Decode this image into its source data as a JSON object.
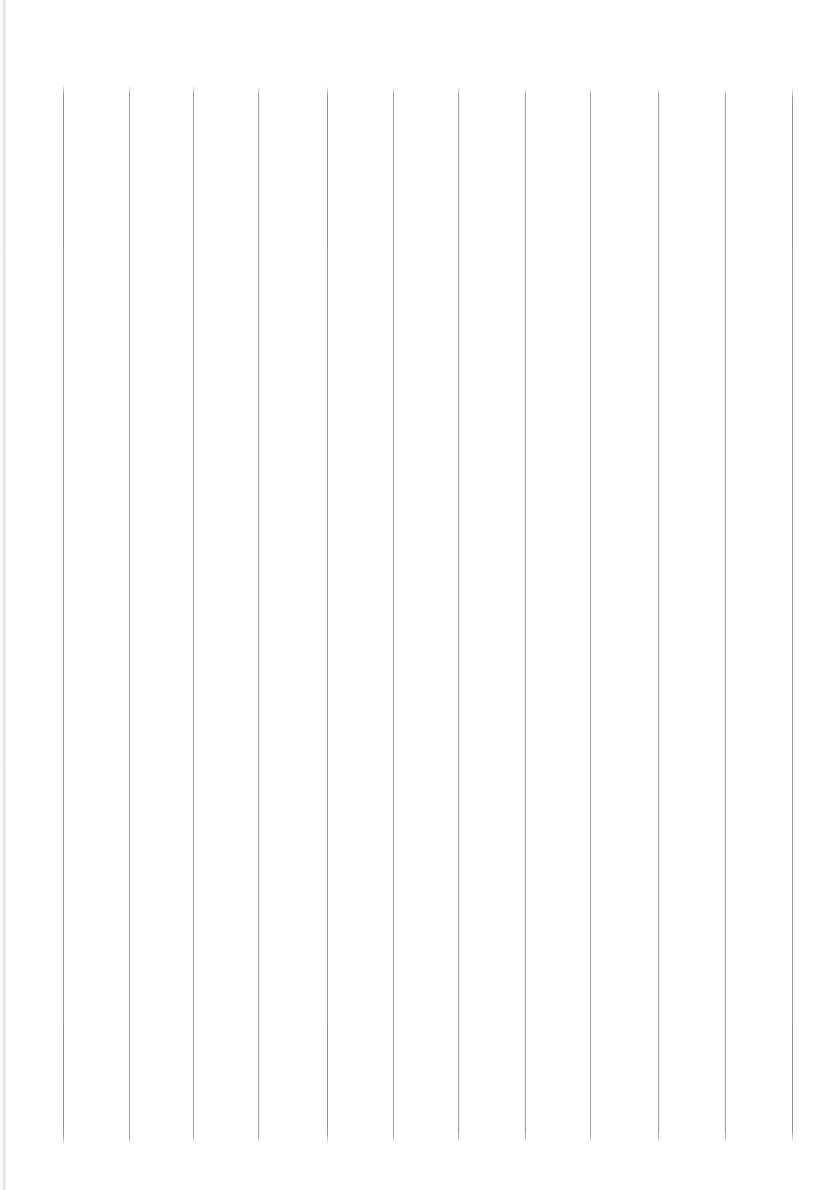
{
  "document": {
    "kind": "scanned-blank-ruled-sheet",
    "title": "",
    "visible_text": "",
    "page_width": 837,
    "page_height": 1190,
    "background_color": "#ffffff",
    "orientation": "portrait"
  },
  "ruling": {
    "line_color": "#8e8e92",
    "line_width": 1,
    "line_count": 12,
    "top_margin": 85,
    "bottom_margin": 1145,
    "left_margin": 63,
    "right_margin": 792,
    "average_spacing": 66.3,
    "lines": [
      {
        "x": 63,
        "top": 85,
        "bottom": 1145
      },
      {
        "x": 129,
        "top": 85,
        "bottom": 1145
      },
      {
        "x": 193,
        "top": 85,
        "bottom": 1144
      },
      {
        "x": 258,
        "top": 86,
        "bottom": 1144
      },
      {
        "x": 327,
        "top": 86,
        "bottom": 1144
      },
      {
        "x": 393,
        "top": 86,
        "bottom": 1143
      },
      {
        "x": 458,
        "top": 86,
        "bottom": 1143
      },
      {
        "x": 525,
        "top": 87,
        "bottom": 1143
      },
      {
        "x": 590,
        "top": 87,
        "bottom": 1143
      },
      {
        "x": 658,
        "top": 87,
        "bottom": 1142
      },
      {
        "x": 725,
        "top": 88,
        "bottom": 1142
      },
      {
        "x": 792,
        "top": 88,
        "bottom": 1142
      }
    ]
  },
  "artifacts": {
    "scan_edge_left_color": "#a8aeb8",
    "paper_tint_color": "#f6f7f9"
  }
}
